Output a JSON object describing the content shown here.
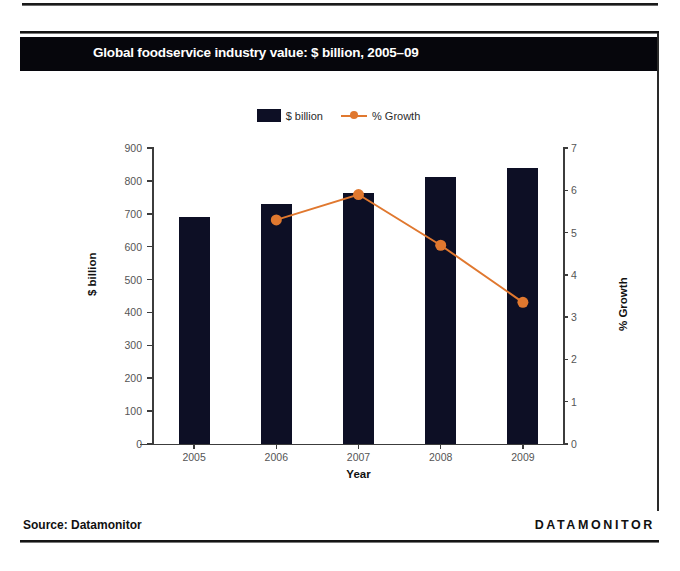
{
  "figure": {
    "title": "Global foodservice industry value: $ billion, 2005–09",
    "source": "Source: Datamonitor",
    "brand": "DATAMONITOR"
  },
  "legend": {
    "items": [
      {
        "label": "$ billion",
        "marker": "bar-swatch",
        "color": "#0d0f25"
      },
      {
        "label": "% Growth",
        "marker": "line-marker",
        "color": "#e0782f"
      }
    ]
  },
  "chart_data": {
    "type": "bar",
    "title": "Global foodservice industry value: $ billion, 2005–09",
    "categories": [
      "2005",
      "2006",
      "2007",
      "2008",
      "2009"
    ],
    "xlabel": "Year",
    "ylabel": "$ billion",
    "ylim": [
      0,
      900
    ],
    "yticks": [
      0,
      100,
      200,
      300,
      400,
      500,
      600,
      700,
      800,
      900
    ],
    "y2label": "% Growth",
    "y2lim": [
      0,
      7
    ],
    "y2ticks": [
      0,
      1,
      2,
      3,
      4,
      5,
      6,
      7
    ],
    "grid": false,
    "legend_position": "top-center",
    "series": [
      {
        "name": "$ billion",
        "type": "bar",
        "axis": "left",
        "color": "#0d0f25",
        "values": [
          690,
          729,
          763,
          813,
          838
        ]
      },
      {
        "name": "% Growth",
        "type": "line",
        "axis": "right",
        "color": "#e0782f",
        "values": [
          null,
          5.3,
          5.9,
          4.7,
          3.35
        ]
      }
    ]
  }
}
